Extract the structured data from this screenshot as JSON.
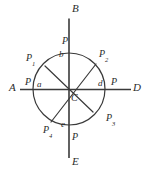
{
  "figure": {
    "kind": "geometry-diagram",
    "background_color": "#ffffff",
    "stroke_color": "#3a3a3a",
    "text_color": "#2b2b2b",
    "circle": {
      "center_x": 69,
      "center_y": 89,
      "radius": 36
    },
    "axes": [
      {
        "name": "horizontal-axis",
        "start_label": "A",
        "end_label": "D",
        "x1": 20,
        "y1": 89,
        "x2": 131,
        "y2": 89
      },
      {
        "name": "vertical-axis",
        "start_label": "B",
        "end_label": "E",
        "x1": 69,
        "y1": 18,
        "x2": 69,
        "y2": 158
      }
    ],
    "chords": [
      {
        "name": "chord-p1-p3",
        "from_label": "P1",
        "to_label": "P3",
        "x1": 45,
        "y1": 66,
        "x2": 93,
        "y2": 112
      },
      {
        "name": "chord-p2-p4",
        "from_label": "P2",
        "to_label": "P4",
        "x1": 96,
        "y1": 64,
        "x2": 51,
        "y2": 122
      }
    ],
    "labels": {
      "axis_a": "A",
      "axis_b": "B",
      "axis_d": "D",
      "axis_e": "E",
      "center": "C",
      "point_p1_base": "P",
      "point_p1_sub": "1",
      "point_p2_base": "P",
      "point_p2_sub": "2",
      "point_p3_base": "P",
      "point_p3_sub": "3",
      "point_p4_base": "P",
      "point_p4_sub": "4",
      "p_top": "P",
      "p_left": "P",
      "p_right": "P",
      "p_bottom": "P",
      "arc_a": "a",
      "arc_b": "b",
      "arc_d": "d",
      "arc_e": "e"
    }
  }
}
